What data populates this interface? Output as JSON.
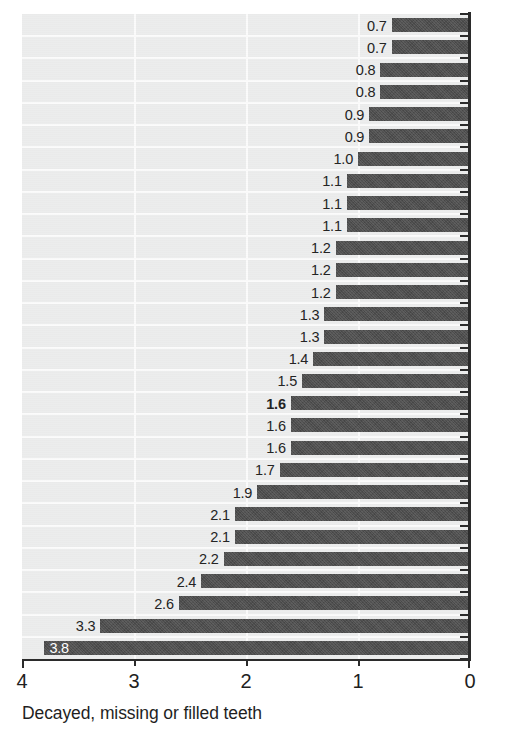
{
  "chart_data": {
    "type": "bar",
    "orientation": "horizontal",
    "title": "",
    "xlabel": "Decayed, missing or filled teeth",
    "ylabel": "",
    "xlim": [
      4,
      0
    ],
    "x_reversed": true,
    "grid": true,
    "legend": null,
    "tick_labels": [
      "4",
      "3",
      "2",
      "1",
      "0"
    ],
    "tick_values": [
      4,
      3,
      2,
      1,
      0
    ],
    "bar_color": "#4e4e4e",
    "panel_color": "#eceded",
    "gridline_color": "#fbfbfb",
    "axis_color": "#2b2b2b",
    "highlight_note": "The value 1.6 is shown in bold",
    "categories": [
      "",
      "",
      "",
      "",
      "",
      "",
      "",
      "",
      "",
      "",
      "",
      "",
      "",
      "",
      "",
      "",
      "",
      "",
      "",
      "",
      "",
      "",
      "",
      "",
      "",
      "",
      "",
      "",
      ""
    ],
    "values": [
      0.7,
      0.7,
      0.8,
      0.8,
      0.9,
      0.9,
      1.0,
      1.1,
      1.1,
      1.1,
      1.2,
      1.2,
      1.2,
      1.3,
      1.3,
      1.4,
      1.5,
      1.6,
      1.6,
      1.6,
      1.7,
      1.9,
      2.1,
      2.1,
      2.2,
      2.4,
      2.6,
      3.3,
      3.8
    ],
    "data_labels": [
      "0.7",
      "0.7",
      "0.8",
      "0.8",
      "0.9",
      "0.9",
      "1.0",
      "1.1",
      "1.1",
      "1.1",
      "1.2",
      "1.2",
      "1.2",
      "1.3",
      "1.3",
      "1.4",
      "1.5",
      "1.6",
      "1.6",
      "1.6",
      "1.7",
      "1.9",
      "2.1",
      "2.1",
      "2.2",
      "2.4",
      "2.6",
      "3.3",
      "3.8"
    ],
    "bold_indices": [
      17
    ],
    "inside_label_indices": [
      28
    ]
  },
  "axis": {
    "x_title": "Decayed, missing or filled teeth",
    "ticks": [
      "4",
      "3",
      "2",
      "1",
      "0"
    ]
  }
}
